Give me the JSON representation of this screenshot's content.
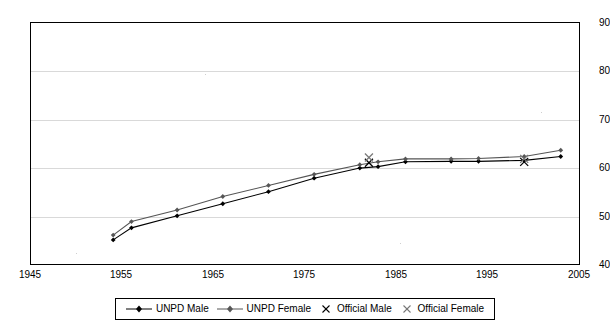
{
  "chart_data": {
    "type": "line",
    "title": "",
    "xlabel": "",
    "ylabel": "",
    "xlim": [
      1945,
      2005
    ],
    "ylim": [
      40,
      90
    ],
    "xticks": [
      1945,
      1955,
      1965,
      1975,
      1985,
      1995,
      2005
    ],
    "yticks": [
      40,
      50,
      60,
      70,
      80,
      90
    ],
    "grid": "horizontal",
    "legend_position": "bottom",
    "series": [
      {
        "name": "UNPD Male",
        "marker": "filled-diamond",
        "color": "#000000",
        "x": [
          1954,
          1956,
          1961,
          1966,
          1971,
          1976,
          1981,
          1983,
          1986,
          1991,
          1994,
          1999,
          2003
        ],
        "y": [
          45.0,
          47.5,
          50.0,
          52.5,
          55.0,
          57.8,
          59.9,
          60.2,
          61.2,
          61.3,
          61.3,
          61.5,
          62.3
        ]
      },
      {
        "name": "UNPD Female",
        "marker": "filled-diamond",
        "color": "#555555",
        "x": [
          1954,
          1956,
          1961,
          1966,
          1971,
          1976,
          1981,
          1983,
          1986,
          1991,
          1994,
          1999,
          2003
        ],
        "y": [
          46.0,
          48.8,
          51.2,
          54.0,
          56.3,
          58.6,
          60.6,
          61.2,
          61.8,
          61.8,
          61.9,
          62.3,
          63.6
        ]
      },
      {
        "name": "Official Male",
        "marker": "cross-x",
        "color": "#000000",
        "x": [
          1982,
          1999
        ],
        "y": [
          61.0,
          61.2
        ]
      },
      {
        "name": "Official Female",
        "marker": "cross-x",
        "color": "#777777",
        "x": [
          1982,
          1999
        ],
        "y": [
          62.1,
          61.8
        ]
      }
    ]
  },
  "axis": {
    "ytick_labels": [
      "90",
      "80",
      "70",
      "60",
      "50",
      "40"
    ],
    "xtick_labels": [
      "1945",
      "1955",
      "1965",
      "1975",
      "1985",
      "1995",
      "2005"
    ]
  },
  "legend": {
    "items": [
      {
        "label": "UNPD Male",
        "marker": "filled-diamond-line"
      },
      {
        "label": "UNPD Female",
        "marker": "filled-diamond-line"
      },
      {
        "label": "Official Male",
        "marker": "cross-x"
      },
      {
        "label": "Official Female",
        "marker": "cross-x"
      }
    ]
  }
}
